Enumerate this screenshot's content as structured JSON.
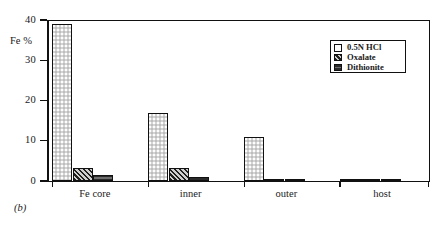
{
  "figure": {
    "caption": "(b)",
    "y_axis_title": "Fe %"
  },
  "legend": {
    "items": [
      {
        "label": "0.5N HCl",
        "swatch": "open-square-swatch"
      },
      {
        "label": "Oxalate",
        "swatch": "hatched-square-swatch"
      },
      {
        "label": "Dithionite",
        "swatch": "dark-banded-square-swatch"
      }
    ]
  },
  "chart_data": {
    "type": "bar",
    "title": "",
    "xlabel": "",
    "ylabel": "Fe %",
    "ylim": [
      0,
      40
    ],
    "yticks": [
      0,
      10,
      20,
      30,
      40
    ],
    "ytick_labels": [
      "0",
      "10",
      "20",
      "30",
      "40"
    ],
    "grid": false,
    "legend_position": "top-right",
    "categories": [
      "Fe core",
      "inner",
      "outer",
      "host"
    ],
    "series": [
      {
        "name": "0.5N HCl",
        "values": [
          39.0,
          17.0,
          11.0,
          0.4
        ],
        "color": "#d4d4d4"
      },
      {
        "name": "Oxalate",
        "values": [
          3.2,
          3.3,
          0.6,
          0.4
        ],
        "color": "#58585a"
      },
      {
        "name": "Dithionite",
        "values": [
          1.5,
          1.1,
          0.5,
          0.4
        ],
        "color": "#303030"
      }
    ]
  }
}
